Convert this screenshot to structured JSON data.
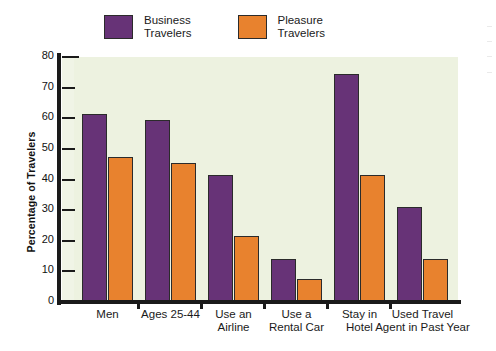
{
  "chart_data": {
    "type": "bar",
    "title": "",
    "xlabel": "",
    "ylabel": "Percentage of Travelers",
    "ylim": [
      0,
      80
    ],
    "ytick_step": 10,
    "yticks": [
      "0",
      "10",
      "20",
      "30",
      "40",
      "50",
      "60",
      "70",
      "80"
    ],
    "grid": false,
    "legend_position": "top",
    "categories": [
      "Men",
      "Ages 25-44",
      "Use an\nAirline",
      "Use a\nRental Car",
      "Stay in\nHotel",
      "Used Travel\nAgent in Past Year"
    ],
    "series": [
      {
        "name": "Business\nTravelers",
        "legend_label": "Business\nTravelers",
        "color": "#673377",
        "values": [
          61.5,
          59.5,
          41.5,
          14,
          74.5,
          31
        ]
      },
      {
        "name": "Pleasure\nTravelers",
        "legend_label": "Pleasure\nTravelers",
        "color": "#e8822e",
        "values": [
          47.5,
          45.5,
          21.5,
          7.5,
          41.5,
          14
        ]
      }
    ],
    "colors": {
      "plot_background": "#edf2e0",
      "page_background": "#ffffff",
      "axis": "#1a1a1a",
      "bar_outline": "#2b2b2b",
      "business": "#673377",
      "pleasure": "#e8822e"
    }
  }
}
